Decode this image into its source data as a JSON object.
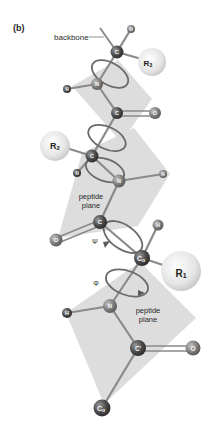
{
  "figure": {
    "panel_label": "(b)",
    "labels": {
      "backbone": "backbone",
      "peptide_plane_1": [
        "peptide",
        "plane"
      ],
      "peptide_plane_2": [
        "peptide",
        "plane"
      ],
      "psi": "Ψ",
      "phi": "Φ"
    },
    "atoms": {
      "calpha_top": "C",
      "h_top": "H",
      "r3": "R",
      "r3_sub": "3",
      "n_1": "N",
      "h_n1": "H",
      "c_1": "C",
      "o_1": "O",
      "calpha_mid": "C",
      "r2": "R",
      "r2_sub": "2",
      "h_mid": "H",
      "n_2": "N",
      "h_n2": "H",
      "c_2": "C",
      "o_2": "O",
      "h_calpha1": "H",
      "calpha_1": "C",
      "calpha_1_sub": "α",
      "r1": "R",
      "r1_sub": "1",
      "n_3": "N",
      "h_n3": "H",
      "c_3": "C'",
      "o_3": "O",
      "calpha_bottom": "C",
      "calpha_bottom_sub": "α"
    },
    "colors": {
      "plane": "#d6d6d6",
      "bond": "#8a8a8a",
      "ring": "#6e6e6e",
      "atom_dark": "#4a4a4a",
      "atom_mid": "#777777",
      "r_sphere": "#e6e6e6"
    }
  }
}
